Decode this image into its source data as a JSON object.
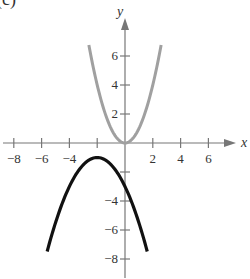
{
  "panel_label": "(c)",
  "chart_data": {
    "type": "line",
    "title": "",
    "xlabel": "x",
    "ylabel": "y",
    "xlim": [
      -9,
      7.5
    ],
    "ylim": [
      -9,
      7.5
    ],
    "grid": false,
    "x_ticks": [
      -8,
      -6,
      -4,
      -2,
      2,
      4,
      6
    ],
    "x_tick_labels": [
      "−8",
      "−6",
      "−4",
      "",
      "2",
      "4",
      "6"
    ],
    "y_ticks": [
      6,
      4,
      2,
      -2,
      -4,
      -6,
      -8
    ],
    "y_tick_labels": [
      "6",
      "4",
      "2",
      "",
      "−4",
      "−6",
      "−8"
    ],
    "series": [
      {
        "name": "y = x^2",
        "color": "#a0a0a0",
        "x": [
          -2.6,
          -2,
          -1,
          0,
          1,
          2,
          2.6
        ],
        "y": [
          6.76,
          4,
          1,
          0,
          1,
          4,
          6.76
        ]
      },
      {
        "name": "y = -(1/2)(x+2)^2 - 1",
        "color": "#111111",
        "x": [
          -5.6,
          -5,
          -4,
          -3,
          -2,
          -1,
          0,
          1,
          1.6
        ],
        "y": [
          -7.48,
          -5.5,
          -3,
          -1.5,
          -1,
          -1.5,
          -3,
          -5.5,
          -7.48
        ]
      }
    ]
  }
}
